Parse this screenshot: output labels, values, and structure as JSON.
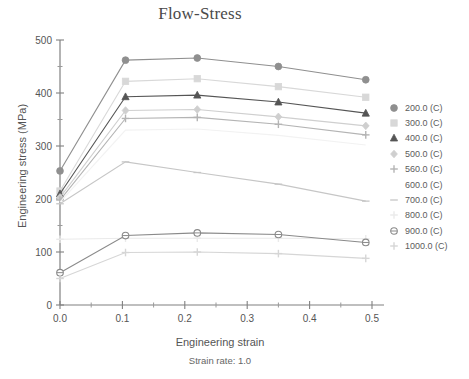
{
  "chart_data": {
    "type": "line",
    "title": "Flow-Stress",
    "subtitle": "Strain rate: 1.0",
    "xlabel": "Engineering strain",
    "ylabel": "Engineering stress (MPa)",
    "xlim": [
      0.0,
      0.5
    ],
    "ylim": [
      0,
      500
    ],
    "xticks": [
      "0.0",
      "0.1",
      "0.2",
      "0.3",
      "0.4",
      "0.5"
    ],
    "xtick_values": [
      0.0,
      0.1,
      0.2,
      0.3,
      0.4,
      0.5
    ],
    "yticks": [
      "0",
      "100",
      "200",
      "300",
      "400",
      "500"
    ],
    "ytick_values": [
      0,
      100,
      200,
      300,
      400,
      500
    ],
    "x_minor_step": 0.05,
    "y_minor_step": 50,
    "grid": false,
    "legend_position": "right",
    "x": [
      0.0,
      0.105,
      0.22,
      0.35,
      0.49
    ],
    "series": [
      {
        "name": "200.0 (C)",
        "label": "200.0 (C)",
        "marker": "circle",
        "color": "#8f8f8f",
        "values": [
          253,
          462,
          466,
          450,
          425
        ]
      },
      {
        "name": "300.0 (C)",
        "label": "300.0 (C)",
        "marker": "square",
        "color": "#d8d8d8",
        "values": [
          215,
          422,
          427,
          412,
          392
        ]
      },
      {
        "name": "400.0 (C)",
        "label": "400.0 (C)",
        "marker": "triangle",
        "color": "#555555",
        "values": [
          210,
          393,
          396,
          383,
          362
        ]
      },
      {
        "name": "500.0 (C)",
        "label": "500.0 (C)",
        "marker": "diamond",
        "color": "#cfcfcf",
        "values": [
          203,
          367,
          369,
          355,
          338
        ]
      },
      {
        "name": "560.0 (C)",
        "label": "560.0 (C)",
        "marker": "plus",
        "color": "#b4b4b4",
        "values": [
          198,
          352,
          354,
          341,
          321
        ]
      },
      {
        "name": "600.0 (C)",
        "label": "600.0 (C)",
        "marker": "none",
        "color": "#f2f2f2",
        "values": [
          194,
          330,
          332,
          320,
          302
        ]
      },
      {
        "name": "700.0 (C)",
        "label": "700.0 (C)",
        "marker": "dash",
        "color": "#c6c6c6",
        "values": [
          191,
          270,
          250,
          228,
          196
        ]
      },
      {
        "name": "800.0 (C)",
        "label": "800.0 (C)",
        "marker": "plus-light",
        "color": "#eaeaea",
        "values": [
          124,
          126,
          126,
          126,
          125
        ]
      },
      {
        "name": "900.0 (C)",
        "label": "900.0 (C)",
        "marker": "circle-open",
        "color": "#8a8a8a",
        "values": [
          61,
          131,
          136,
          133,
          118
        ]
      },
      {
        "name": "1000.0 (C)",
        "label": "1000.0 (C)",
        "marker": "plus-faint",
        "color": "#d6d6d6",
        "values": [
          50,
          99,
          100,
          97,
          88
        ]
      }
    ]
  },
  "legend": {
    "items": [
      {
        "label": "200.0 (C)"
      },
      {
        "label": "300.0 (C)"
      },
      {
        "label": "400.0 (C)"
      },
      {
        "label": "500.0 (C)"
      },
      {
        "label": "560.0 (C)"
      },
      {
        "label": "600.0 (C)"
      },
      {
        "label": "700.0 (C)"
      },
      {
        "label": "800.0 (C)"
      },
      {
        "label": "900.0 (C)"
      },
      {
        "label": "1000.0 (C)"
      }
    ]
  },
  "icons": {
    "circle": "circle-marker-icon",
    "square": "square-marker-icon",
    "triangle": "triangle-marker-icon",
    "diamond": "diamond-marker-icon",
    "plus": "plus-marker-icon",
    "dash": "dash-marker-icon",
    "circle-open": "circle-open-marker-icon",
    "none": "blank-marker-icon"
  }
}
